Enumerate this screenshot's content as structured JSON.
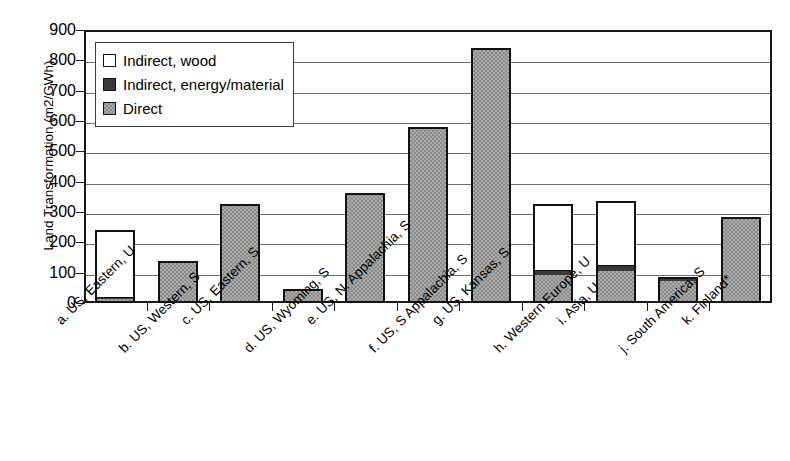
{
  "chart_data": {
    "type": "bar",
    "title": "",
    "subtitle": "",
    "xlabel": "",
    "ylabel": "Land Transformation (m2/GWh)",
    "ylim": [
      0,
      900
    ],
    "ytick_step": 100,
    "yticks": [
      900,
      800,
      700,
      600,
      500,
      400,
      300,
      200,
      100,
      0
    ],
    "grid": "horizontal",
    "stacked": true,
    "legend_position": "upper-left-inside",
    "categories": [
      "a. US, Eastern, U",
      "b. US, Western, S",
      "c. US, Eastern, S",
      "d. US, Wyoming, S",
      "e. US, N. Appalachia, S",
      "f. US, S Appalachia, S",
      "g. US, Kansas, S",
      "h. Western Europe, U",
      "i. Asia, U",
      "j. South America, S",
      "k. Finland*"
    ],
    "series": [
      {
        "name": "Direct",
        "color": "#8c8c8c",
        "values": [
          5,
          137,
          315,
          45,
          352,
          570,
          840,
          85,
          100,
          65,
          285
        ]
      },
      {
        "name": "Indirect, energy/material",
        "color": "#3a3a3a",
        "values": [
          6,
          0,
          10,
          0,
          10,
          10,
          0,
          15,
          15,
          20,
          0
        ]
      },
      {
        "name": "Indirect, wood",
        "color": "#ffffff",
        "values": [
          229,
          0,
          0,
          0,
          0,
          0,
          0,
          225,
          220,
          0,
          0
        ]
      }
    ],
    "totals": [
      240,
      137,
      325,
      45,
      362,
      580,
      840,
      325,
      335,
      85,
      285
    ]
  },
  "legend": {
    "items": [
      {
        "label": "Indirect, wood",
        "swatch": "legend-swatch-wood"
      },
      {
        "label": "Indirect, energy/material",
        "swatch": "legend-swatch-energy"
      },
      {
        "label": "Direct",
        "swatch": "legend-swatch-direct"
      }
    ]
  },
  "axis": {
    "y_title": "Land Transformation (m2/GWh)"
  }
}
